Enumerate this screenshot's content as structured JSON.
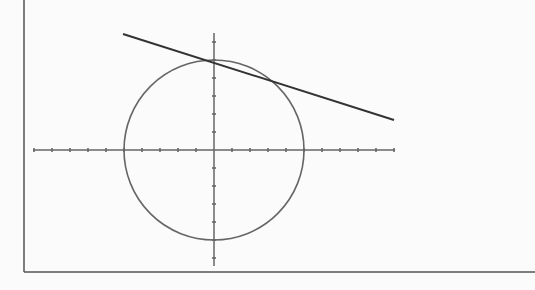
{
  "figure": {
    "frame": {
      "left_x": 24,
      "bottom_y": 272,
      "right_x": 535,
      "top_y": 0,
      "color": "#555555"
    },
    "axes": {
      "origin_px": [
        214,
        150
      ],
      "unit_px": 18,
      "x_axis": {
        "from_px": 33,
        "to_px": 395,
        "ticks_units": [
          -10,
          -9,
          -8,
          -7,
          -6,
          -5,
          -4,
          -3,
          -2,
          -1,
          1,
          2,
          3,
          4,
          5,
          6,
          7,
          8,
          9,
          10
        ]
      },
      "y_axis": {
        "from_px": 33,
        "to_px": 266,
        "ticks_units": [
          -6,
          -5,
          -4,
          -3,
          -2,
          -1,
          1,
          2,
          3,
          4,
          5,
          6
        ]
      },
      "color": "#666666"
    },
    "circle": {
      "center_units": [
        0,
        0
      ],
      "radius_units": 5,
      "color": "#666666"
    },
    "tangent_line": {
      "from_px": [
        123,
        34
      ],
      "to_px": [
        394,
        120
      ],
      "color": "#333333"
    }
  }
}
